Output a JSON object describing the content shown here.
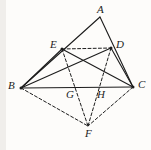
{
  "figure": {
    "type": "geometry-diagram",
    "background_color": "#fdfcfa",
    "stroke_color": "#1c1c1c",
    "solid_width": 1.1,
    "dashed_width": 1.0,
    "dash_pattern": "3,2.2",
    "points": [
      {
        "name": "A",
        "label": "A",
        "x": 100,
        "y": 17,
        "label_x": 97,
        "label_y": 4,
        "dot": false
      },
      {
        "name": "B",
        "label": "B",
        "x": 21,
        "y": 88,
        "label_x": 8,
        "label_y": 80,
        "dot": true
      },
      {
        "name": "C",
        "label": "C",
        "x": 133,
        "y": 87,
        "label_x": 138,
        "label_y": 79,
        "dot": true
      },
      {
        "name": "D",
        "label": "D",
        "x": 111,
        "y": 48,
        "label_x": 116,
        "label_y": 39,
        "dot": true
      },
      {
        "name": "E",
        "label": "E",
        "x": 62,
        "y": 49,
        "label_x": 50,
        "label_y": 39,
        "dot": true
      },
      {
        "name": "F",
        "label": "F",
        "x": 88,
        "y": 126,
        "label_x": 85,
        "label_y": 128,
        "dot": false
      },
      {
        "name": "G",
        "label": "G",
        "x": 76,
        "y": 88,
        "label_x": 66,
        "label_y": 89,
        "dot": false
      },
      {
        "name": "H",
        "label": "H",
        "x": 107,
        "y": 88,
        "label_x": 97,
        "label_y": 89,
        "dot": false
      }
    ],
    "solid_segments": [
      {
        "name": "segment-AB",
        "from": "A",
        "to": "B"
      },
      {
        "name": "segment-AC",
        "from": "A",
        "to": "C"
      },
      {
        "name": "segment-BC",
        "from": "B",
        "to": "C"
      },
      {
        "name": "segment-BD",
        "from": "B",
        "to": "D"
      },
      {
        "name": "segment-EC",
        "from": "E",
        "to": "C"
      },
      {
        "name": "segment-BE",
        "from": "B",
        "to": "E"
      },
      {
        "name": "segment-DC",
        "from": "D",
        "to": "C"
      }
    ],
    "dashed_segments": [
      {
        "name": "segment-ED",
        "from": "E",
        "to": "D"
      },
      {
        "name": "segment-EF",
        "from": "E",
        "to": "F"
      },
      {
        "name": "segment-DF",
        "from": "D",
        "to": "F"
      },
      {
        "name": "segment-BF",
        "from": "B",
        "to": "F"
      },
      {
        "name": "segment-CF",
        "from": "C",
        "to": "F"
      }
    ]
  }
}
